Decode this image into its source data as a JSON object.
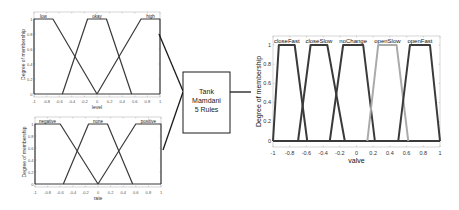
{
  "chart_data": [
    {
      "type": "line",
      "name": "input-level",
      "xlabel": "level",
      "ylabel": "Degree of membership",
      "xlim": [
        -1,
        1
      ],
      "ylim": [
        0,
        1
      ],
      "xticks": [
        "-1",
        "-0.8",
        "-0.6",
        "-0.4",
        "-0.2",
        "0",
        "0.2",
        "0.4",
        "0.6",
        "0.8",
        "1"
      ],
      "yticks": [
        "0",
        "0.2",
        "0.4",
        "0.6",
        "0.8",
        "1"
      ],
      "series": [
        {
          "name": "low",
          "params": [
            -1,
            -1,
            -0.7,
            0
          ]
        },
        {
          "name": "okay",
          "params": [
            -0.55,
            -0.15,
            0.15,
            0.55
          ]
        },
        {
          "name": "high",
          "params": [
            0,
            0.7,
            1,
            1
          ]
        }
      ]
    },
    {
      "type": "line",
      "name": "input-rate",
      "xlabel": "rate",
      "ylabel": "Degree of membership",
      "xlim": [
        -1,
        1
      ],
      "ylim": [
        0,
        1
      ],
      "xticks": [
        "-1",
        "-0.8",
        "-0.6",
        "-0.4",
        "-0.2",
        "0",
        "0.2",
        "0.4",
        "0.6",
        "0.8",
        "1"
      ],
      "yticks": [
        "0",
        "0.2",
        "0.4",
        "0.6",
        "0.8",
        "1"
      ],
      "series": [
        {
          "name": "negative",
          "params": [
            -1,
            -1,
            -0.6,
            0
          ]
        },
        {
          "name": "none",
          "params": [
            -0.55,
            -0.15,
            0.15,
            0.55
          ]
        },
        {
          "name": "positive",
          "params": [
            0,
            0.6,
            1,
            1
          ]
        }
      ]
    },
    {
      "type": "line",
      "name": "output-valve",
      "xlabel": "valve",
      "ylabel": "Degree of membership",
      "xlim": [
        -1,
        1
      ],
      "ylim": [
        0,
        1
      ],
      "xticks": [
        "-1",
        "-0.8",
        "-0.6",
        "-0.4",
        "-0.2",
        "0",
        "0.2",
        "0.4",
        "0.6",
        "0.8",
        "1"
      ],
      "yticks": [
        "0",
        "0.2",
        "0.4",
        "0.6",
        "0.8",
        "1"
      ],
      "series": [
        {
          "name": "closeFast",
          "params": [
            -1,
            -0.93,
            -0.74,
            -0.59
          ]
        },
        {
          "name": "closeSlow",
          "params": [
            -0.7,
            -0.55,
            -0.35,
            -0.14
          ]
        },
        {
          "name": "noChange",
          "params": [
            -0.32,
            -0.16,
            0.08,
            0.22
          ]
        },
        {
          "name": "openSlow",
          "params": [
            0.13,
            0.26,
            0.48,
            0.62
          ]
        },
        {
          "name": "openFast",
          "params": [
            0.5,
            0.64,
            0.88,
            1
          ]
        }
      ]
    }
  ],
  "system_box": {
    "line1": "Tank",
    "line2": "Mamdani",
    "line3": "5 Rules"
  },
  "colors": {
    "line": "#3a3a3a",
    "highlight": "#aaaaaa",
    "frame": "#bbbbbb",
    "connector": "#1a1a1a"
  }
}
